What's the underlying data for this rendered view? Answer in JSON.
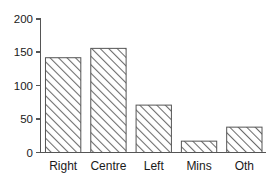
{
  "chart_data": {
    "type": "bar",
    "title": "",
    "subtitle": "",
    "xlabel": "",
    "ylabel": "",
    "categories": [
      "Right",
      "Centre",
      "Left",
      "Mins",
      "Oth"
    ],
    "values": [
      142,
      156,
      71,
      17,
      38
    ],
    "ylim": [
      0,
      200
    ],
    "yticks": [
      0,
      50,
      100,
      150,
      200
    ],
    "ytick_labels": [
      "0",
      "50",
      "100",
      "150",
      "200"
    ],
    "grid": false,
    "legend": null,
    "bar_fill": "hatched-diagonal",
    "bar_edge_color": "#555555",
    "background_color": "#ffffff",
    "text_color": "#1a1a1a"
  },
  "axes": {
    "y_axis_name": "value-axis",
    "x_axis_name": "category-axis"
  }
}
